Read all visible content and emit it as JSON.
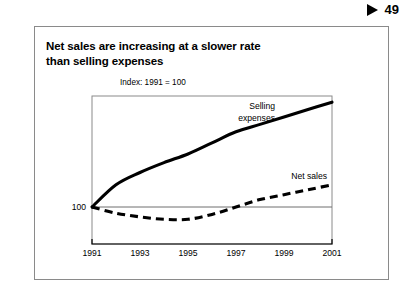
{
  "page_marker": {
    "icon": "triangle-right-icon",
    "folio": "49"
  },
  "exhibit": {
    "title_line1": "Net sales are increasing at a slower rate",
    "title_line2": "than selling expenses",
    "index_note": "Index: 1991 = 100"
  },
  "chart_data": {
    "type": "line",
    "title": "Net sales are increasing at a slower rate than selling expenses",
    "subtitle": "Index: 1991 = 100",
    "xlabel": "",
    "ylabel": "",
    "grid": false,
    "legend": "inline-labels",
    "baseline": 100,
    "x": [
      1991,
      1992,
      1993,
      1994,
      1995,
      1996,
      1997,
      1998,
      1999,
      2000,
      2001
    ],
    "xticks": [
      "1991",
      "1993",
      "1995",
      "1997",
      "1999",
      "2001"
    ],
    "xlim": [
      1991,
      2001
    ],
    "ylim": [
      70,
      190
    ],
    "yticks": [
      "100"
    ],
    "series": [
      {
        "name": "Selling expenses",
        "style": "solid",
        "color": "#000000",
        "label_line1": "Selling",
        "label_line2": "expenses",
        "values": [
          100,
          118,
          128,
          136,
          143,
          152,
          161,
          167,
          173,
          179,
          185
        ]
      },
      {
        "name": "Net sales",
        "style": "dashed",
        "color": "#000000",
        "label_line1": "Net sales",
        "label_line2": "",
        "values": [
          100,
          95,
          92,
          90,
          90,
          94,
          100,
          106,
          110,
          114,
          118
        ]
      }
    ]
  }
}
